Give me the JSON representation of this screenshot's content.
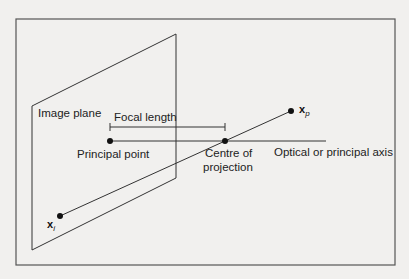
{
  "diagram": {
    "type": "pinhole camera model",
    "colors": {
      "background": "#f1f0ee",
      "stroke": "#333333",
      "frame": "#555555",
      "text": "#222222"
    },
    "frame": {
      "x": 16,
      "y": 19,
      "width": 379,
      "height": 246
    },
    "image_plane": {
      "label": "Image plane",
      "corners": [
        [
          32,
          106
        ],
        [
          176,
          34
        ],
        [
          176,
          178
        ],
        [
          32,
          250
        ]
      ]
    },
    "focal_length": {
      "label": "Focal length",
      "x1": 110,
      "x2": 225,
      "y": 127
    },
    "optical_axis": {
      "label": "Optical or principal axis",
      "x1": 110,
      "x2": 326,
      "y": 141
    },
    "points": {
      "principal_point": {
        "label": "Principal point",
        "x": 110,
        "y": 141
      },
      "centre_of_projection": {
        "label_line1": "Centre of",
        "label_line2": "projection",
        "x": 225,
        "y": 141
      },
      "x_p": {
        "symbol": "x",
        "subscript": "p",
        "x": 291,
        "y": 111
      },
      "x_i": {
        "symbol": "x",
        "subscript": "i",
        "x": 60,
        "y": 216
      }
    }
  }
}
